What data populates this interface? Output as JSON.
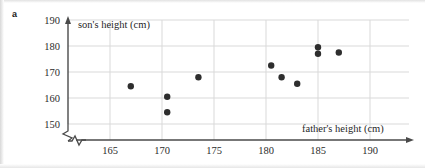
{
  "part_label": "a",
  "colors": {
    "background": "#ffffff",
    "axis": "#4a4a4a",
    "gridline": "#d9d9d9",
    "point": "#2e2e2e",
    "text": "#1f1f1f"
  },
  "chart_data": {
    "type": "scatter",
    "title": "",
    "xlabel": "father's height (cm)",
    "ylabel": "son's height (cm)",
    "xlim": [
      161,
      190
    ],
    "ylim": [
      145,
      190
    ],
    "xticks": [
      165,
      170,
      175,
      180,
      185,
      190
    ],
    "yticks": [
      150,
      160,
      170,
      180,
      190
    ],
    "xtick_labels": [
      "165",
      "170",
      "175",
      "180",
      "185",
      "190"
    ],
    "ytick_labels": [
      "150",
      "160",
      "170",
      "180",
      "190"
    ],
    "grid": true,
    "grid_axes": "both",
    "axis_break": {
      "x": true,
      "y": true,
      "symbol": "zigzag"
    },
    "legend": null,
    "marker": {
      "shape": "circle",
      "size_px": 3.2,
      "color": "#2e2e2e"
    },
    "series": [
      {
        "name": "father-son height pairs",
        "x": [
          167.0,
          170.5,
          170.5,
          173.5,
          180.5,
          181.5,
          183.0,
          185.0,
          185.0,
          187.0
        ],
        "y": [
          164.5,
          160.5,
          154.5,
          168.0,
          172.5,
          168.0,
          165.5,
          179.5,
          177.0,
          177.5
        ]
      }
    ],
    "n_points": 10
  }
}
